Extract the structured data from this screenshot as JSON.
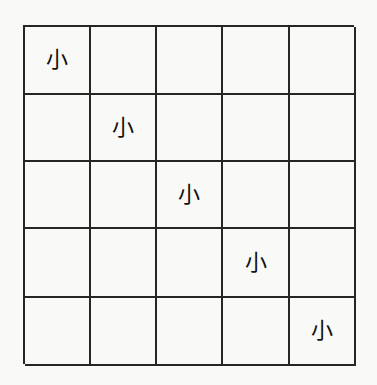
{
  "grid": {
    "rows": 5,
    "cols": 5,
    "line_color": "#262626",
    "background": "#f9f9f7",
    "cells": [
      [
        "小",
        "",
        "",
        "",
        ""
      ],
      [
        "",
        "小",
        "",
        "",
        ""
      ],
      [
        "",
        "",
        "小",
        "",
        ""
      ],
      [
        "",
        "",
        "",
        "小",
        ""
      ],
      [
        "",
        "",
        "",
        "",
        "小"
      ]
    ]
  }
}
